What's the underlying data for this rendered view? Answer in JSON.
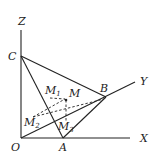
{
  "diagram": {
    "labels": {
      "Z": "Z",
      "C": "C",
      "B": "B",
      "Y": "Y",
      "M": "M",
      "M1": "M",
      "M1_sub": "1",
      "M2": "M",
      "M2_sub": "2",
      "M3": "M",
      "M3_sub": "3",
      "O": "O",
      "A": "A",
      "X": "X"
    },
    "stroke_color": "#222222"
  }
}
